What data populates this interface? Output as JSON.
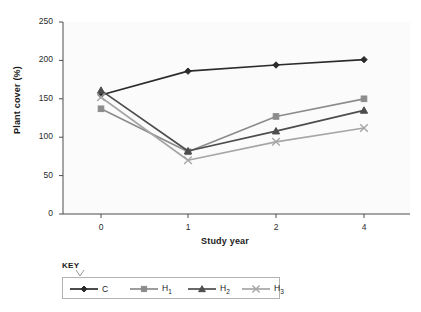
{
  "chart_data": {
    "type": "line",
    "title": "",
    "xlabel": "Study year",
    "ylabel": "Plant cover (%)",
    "categories": [
      "0",
      "1",
      "2",
      "4"
    ],
    "x": [
      0,
      1,
      2,
      4
    ],
    "xtick_labels": [
      "0",
      "1",
      "2",
      "4"
    ],
    "ytick_labels": [
      "0",
      "50",
      "100",
      "150",
      "200",
      "250"
    ],
    "yticks": [
      0,
      50,
      100,
      150,
      200,
      250
    ],
    "ylim": [
      0,
      250
    ],
    "grid": false,
    "legend_position": "below-plot",
    "legend_title": "KEY",
    "series": [
      {
        "name": "C",
        "label": "C",
        "marker": "diamond",
        "color": "#2b2b2b",
        "values": [
          155,
          186,
          194,
          201
        ]
      },
      {
        "name": "H1",
        "label": "H",
        "sub": "1",
        "marker": "square",
        "color": "#8c8c8c",
        "values": [
          137,
          81,
          127,
          150
        ]
      },
      {
        "name": "H2",
        "label": "H",
        "sub": "2",
        "marker": "triangle",
        "color": "#4d4d4d",
        "values": [
          161,
          82,
          108,
          135
        ]
      },
      {
        "name": "H3",
        "label": "H",
        "sub": "3",
        "marker": "cross",
        "color": "#a6a6a6",
        "values": [
          152,
          70,
          94,
          112
        ]
      }
    ]
  },
  "colors": {
    "axis": "#4d4d4d",
    "plot_background": "#fbfbfb",
    "text": "#1a1a1a",
    "legend_border": "#b3b3b3"
  }
}
